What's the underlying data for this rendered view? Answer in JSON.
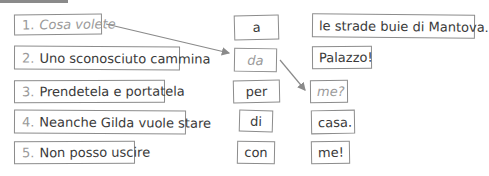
{
  "exercise": {
    "sentence_starts": [
      {
        "number": "1.",
        "text": "Cosa volete",
        "example": true
      },
      {
        "number": "2.",
        "text": "Uno sconosciuto cammina",
        "example": false
      },
      {
        "number": "3.",
        "text": "Prendetela e portatela",
        "example": false
      },
      {
        "number": "4.",
        "text": "Neanche Gilda vuole stare",
        "example": false
      },
      {
        "number": "5.",
        "text": "Non posso uscire",
        "example": false
      }
    ],
    "prepositions": [
      {
        "text": "a",
        "example": false
      },
      {
        "text": "da",
        "example": true
      },
      {
        "text": "per",
        "example": false
      },
      {
        "text": "di",
        "example": false
      },
      {
        "text": "con",
        "example": false
      }
    ],
    "endings": [
      {
        "text": "le strade buie di Mantova.",
        "example": false
      },
      {
        "text": "Palazzo!",
        "example": false
      },
      {
        "text": "me?",
        "example": true
      },
      {
        "text": "casa.",
        "example": false
      },
      {
        "text": "me!",
        "example": false
      }
    ]
  },
  "colors": {
    "border": "#8c8c8c",
    "text": "#3a3a3a",
    "example_text": "#9a9a9a",
    "arrow": "#8a8a8a"
  }
}
